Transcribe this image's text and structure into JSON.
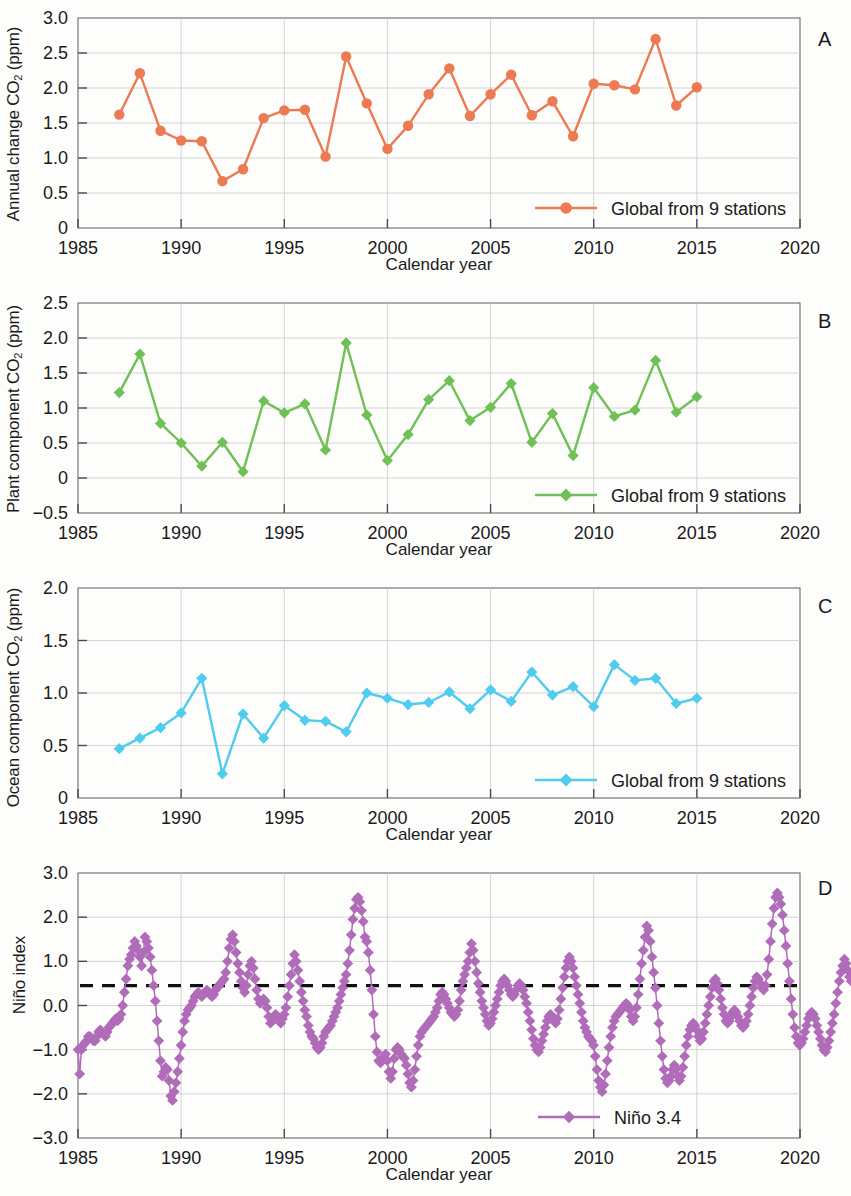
{
  "figure": {
    "xlabel": "Calendar year",
    "panel_letters": [
      "A",
      "B",
      "C",
      "D"
    ]
  },
  "panels": {
    "a": {
      "letter": "A",
      "ylabel_main": "Annual change CO",
      "ylabel_sub": "2",
      "ylabel_tail": " (ppm)",
      "xlabel": "Calendar year",
      "legend": "Global from 9 stations",
      "color": "#EC7A52"
    },
    "b": {
      "letter": "B",
      "ylabel_main": "Plant component CO",
      "ylabel_sub": "2",
      "ylabel_tail": " (ppm)",
      "xlabel": "Calendar year",
      "legend": "Global from 9 stations",
      "color": "#6FC055"
    },
    "c": {
      "letter": "C",
      "ylabel_main": "Ocean component CO",
      "ylabel_sub": "2",
      "ylabel_tail": " (ppm)",
      "xlabel": "Calendar year",
      "legend": "Global from 9 stations",
      "color": "#4FCCEE"
    },
    "d": {
      "letter": "D",
      "ylabel_main": "Niño index",
      "ylabel_sub": "",
      "ylabel_tail": "",
      "xlabel": "Calendar year",
      "legend": "Niño 3.4",
      "color": "#B06CB8",
      "threshold_label": "0.5",
      "threshold_color": "#111111"
    }
  },
  "chart_data": [
    {
      "id": "panel-a",
      "type": "line",
      "title": "",
      "panel": "A",
      "xlabel": "Calendar year",
      "ylabel": "Annual change CO2 (ppm)",
      "xlim": [
        1985,
        2020
      ],
      "ylim": [
        0,
        3.0
      ],
      "xticks": [
        1985,
        1990,
        1995,
        2000,
        2005,
        2010,
        2015,
        2020
      ],
      "yticks": [
        0,
        0.5,
        1.0,
        1.5,
        2.0,
        2.5,
        3.0
      ],
      "ytick_labels": [
        "0",
        "0.5",
        "1.0",
        "1.5",
        "2.0",
        "2.5",
        "3.0"
      ],
      "grid": true,
      "legend_position": "bottom-right",
      "marker": "circle",
      "color": "#EC7A52",
      "series": [
        {
          "name": "Global from 9 stations",
          "x": [
            1987,
            1988,
            1989,
            1990,
            1991,
            1992,
            1993,
            1994,
            1995,
            1996,
            1997,
            1998,
            1999,
            2000,
            2001,
            2002,
            2003,
            2004,
            2005,
            2006,
            2007,
            2008,
            2009,
            2010,
            2011,
            2012,
            2013,
            2014,
            2015
          ],
          "values": [
            1.62,
            2.21,
            1.39,
            1.25,
            1.24,
            0.67,
            0.84,
            1.57,
            1.68,
            1.69,
            1.02,
            2.45,
            1.78,
            1.13,
            1.46,
            1.91,
            2.28,
            1.6,
            1.91,
            2.19,
            1.61,
            1.81,
            1.31,
            2.06,
            2.04,
            1.98,
            2.7,
            1.75,
            2.01
          ]
        }
      ]
    },
    {
      "id": "panel-b",
      "type": "line",
      "title": "",
      "panel": "B",
      "xlabel": "Calendar year",
      "ylabel": "Plant component CO2 (ppm)",
      "xlim": [
        1985,
        2020
      ],
      "ylim": [
        -0.5,
        2.5
      ],
      "xticks": [
        1985,
        1990,
        1995,
        2000,
        2005,
        2010,
        2015,
        2020
      ],
      "yticks": [
        -0.5,
        0,
        0.5,
        1.0,
        1.5,
        2.0,
        2.5
      ],
      "ytick_labels": [
        "−0.5",
        "0",
        "0.5",
        "1.0",
        "1.5",
        "2.0",
        "2.5"
      ],
      "grid": true,
      "legend_position": "bottom-right",
      "marker": "diamond",
      "color": "#6FC055",
      "series": [
        {
          "name": "Global from 9 stations",
          "x": [
            1987,
            1988,
            1989,
            1990,
            1991,
            1992,
            1993,
            1994,
            1995,
            1996,
            1997,
            1998,
            1999,
            2000,
            2001,
            2002,
            2003,
            2004,
            2005,
            2006,
            2007,
            2008,
            2009,
            2010,
            2011,
            2012,
            2013,
            2014,
            2015
          ],
          "values": [
            1.22,
            1.77,
            0.78,
            0.5,
            0.17,
            0.51,
            0.09,
            1.1,
            0.93,
            1.06,
            0.4,
            1.93,
            0.9,
            0.25,
            0.62,
            1.12,
            1.39,
            0.82,
            1.01,
            1.35,
            0.51,
            0.92,
            0.32,
            1.29,
            0.88,
            0.97,
            1.68,
            0.94,
            1.16
          ]
        }
      ]
    },
    {
      "id": "panel-c",
      "type": "line",
      "title": "",
      "panel": "C",
      "xlabel": "Calendar year",
      "ylabel": "Ocean component CO2 (ppm)",
      "xlim": [
        1985,
        2020
      ],
      "ylim": [
        0,
        2.0
      ],
      "xticks": [
        1985,
        1990,
        1995,
        2000,
        2005,
        2010,
        2015,
        2020
      ],
      "yticks": [
        0,
        0.5,
        1.0,
        1.5,
        2.0
      ],
      "ytick_labels": [
        "0",
        "0.5",
        "1.0",
        "1.5",
        "2.0"
      ],
      "grid": true,
      "legend_position": "bottom-right",
      "marker": "diamond",
      "color": "#4FCCEE",
      "series": [
        {
          "name": "Global from 9 stations",
          "x": [
            1987,
            1988,
            1989,
            1990,
            1991,
            1992,
            1993,
            1994,
            1995,
            1996,
            1997,
            1998,
            1999,
            2000,
            2001,
            2002,
            2003,
            2004,
            2005,
            2006,
            2007,
            2008,
            2009,
            2010,
            2011,
            2012,
            2013,
            2014,
            2015
          ],
          "values": [
            0.47,
            0.57,
            0.67,
            0.81,
            1.14,
            0.23,
            0.8,
            0.57,
            0.88,
            0.74,
            0.73,
            0.63,
            1.0,
            0.95,
            0.89,
            0.91,
            1.01,
            0.85,
            1.03,
            0.92,
            1.2,
            0.98,
            1.06,
            0.87,
            1.27,
            1.12,
            1.14,
            0.9,
            0.95
          ]
        }
      ]
    },
    {
      "id": "panel-d",
      "type": "line",
      "title": "",
      "panel": "D",
      "xlabel": "Calendar year",
      "ylabel": "Niño index",
      "xlim": [
        1985,
        2020
      ],
      "ylim": [
        -3.0,
        3.0
      ],
      "xticks": [
        1985,
        1990,
        1995,
        2000,
        2005,
        2010,
        2015,
        2020
      ],
      "yticks": [
        -3.0,
        -2.0,
        -1.0,
        0.0,
        1.0,
        2.0,
        3.0
      ],
      "ytick_labels": [
        "−3.0",
        "−2.0",
        "−1.0",
        "0.0",
        "1.0",
        "2.0",
        "3.0"
      ],
      "grid": true,
      "legend_position": "bottom-center",
      "marker": "diamond",
      "color": "#B06CB8",
      "threshold_line": 0.45,
      "series": [
        {
          "name": "Niño 3.4",
          "x_start": 1985.0,
          "x_step": 0.0833,
          "values": [
            -1.0,
            -1.55,
            -1.0,
            -0.9,
            -0.85,
            -0.8,
            -0.7,
            -0.7,
            -0.75,
            -0.8,
            -0.8,
            -0.7,
            -0.6,
            -0.55,
            -0.6,
            -0.65,
            -0.7,
            -0.6,
            -0.5,
            -0.45,
            -0.4,
            -0.35,
            -0.3,
            -0.35,
            -0.3,
            -0.2,
            0.0,
            0.3,
            0.6,
            0.9,
            1.05,
            1.15,
            1.3,
            1.45,
            1.35,
            1.25,
            1.1,
            0.9,
            1.2,
            1.55,
            1.45,
            1.3,
            1.1,
            0.8,
            0.45,
            0.1,
            -0.35,
            -0.8,
            -1.25,
            -1.6,
            -1.5,
            -1.4,
            -1.45,
            -1.7,
            -2.05,
            -2.15,
            -1.95,
            -1.75,
            -1.5,
            -1.2,
            -0.9,
            -0.6,
            -0.35,
            -0.2,
            -0.1,
            -0.05,
            0.0,
            0.1,
            0.2,
            0.25,
            0.3,
            0.25,
            0.2,
            0.25,
            0.3,
            0.35,
            0.3,
            0.25,
            0.2,
            0.25,
            0.35,
            0.4,
            0.45,
            0.5,
            0.55,
            0.6,
            0.75,
            1.0,
            1.3,
            1.5,
            1.6,
            1.45,
            1.2,
            0.95,
            0.75,
            0.55,
            0.4,
            0.3,
            0.45,
            0.7,
            0.9,
            1.0,
            0.85,
            0.6,
            0.35,
            0.15,
            0.05,
            0.1,
            0.15,
            0.1,
            -0.05,
            -0.25,
            -0.4,
            -0.35,
            -0.25,
            -0.2,
            -0.25,
            -0.35,
            -0.4,
            -0.3,
            -0.2,
            -0.05,
            0.2,
            0.45,
            0.7,
            0.95,
            1.15,
            1.0,
            0.8,
            0.55,
            0.3,
            0.1,
            -0.1,
            -0.25,
            -0.45,
            -0.6,
            -0.7,
            -0.75,
            -0.85,
            -0.95,
            -1.0,
            -0.95,
            -0.85,
            -0.7,
            -0.6,
            -0.55,
            -0.5,
            -0.45,
            -0.35,
            -0.25,
            -0.15,
            -0.05,
            0.1,
            0.25,
            0.4,
            0.55,
            0.7,
            0.95,
            1.25,
            1.6,
            1.95,
            2.2,
            2.4,
            2.45,
            2.35,
            2.15,
            1.9,
            1.55,
            1.45,
            1.2,
            0.8,
            0.35,
            -0.2,
            -0.7,
            -1.05,
            -1.25,
            -1.3,
            -1.25,
            -1.15,
            -1.1,
            -1.25,
            -1.5,
            -1.65,
            -1.5,
            -1.2,
            -1.0,
            -0.95,
            -1.0,
            -1.1,
            -1.15,
            -1.2,
            -1.35,
            -1.55,
            -1.75,
            -1.85,
            -1.7,
            -1.45,
            -1.15,
            -0.9,
            -0.7,
            -0.6,
            -0.55,
            -0.5,
            -0.45,
            -0.4,
            -0.35,
            -0.3,
            -0.25,
            -0.15,
            -0.05,
            0.1,
            0.25,
            0.3,
            0.25,
            0.15,
            0.05,
            -0.05,
            -0.15,
            -0.2,
            -0.25,
            -0.2,
            -0.1,
            0.1,
            0.35,
            0.55,
            0.7,
            0.85,
            1.0,
            1.2,
            1.4,
            1.25,
            1.0,
            0.75,
            0.5,
            0.3,
            0.1,
            -0.05,
            -0.2,
            -0.35,
            -0.45,
            -0.4,
            -0.3,
            -0.15,
            0.0,
            0.15,
            0.3,
            0.45,
            0.55,
            0.6,
            0.55,
            0.45,
            0.35,
            0.25,
            0.2,
            0.25,
            0.35,
            0.45,
            0.5,
            0.45,
            0.35,
            0.2,
            0.05,
            -0.15,
            -0.35,
            -0.55,
            -0.75,
            -0.9,
            -1.0,
            -1.05,
            -0.95,
            -0.8,
            -0.65,
            -0.5,
            -0.35,
            -0.25,
            -0.2,
            -0.25,
            -0.35,
            -0.4,
            -0.3,
            -0.1,
            0.15,
            0.4,
            0.65,
            0.85,
            1.0,
            1.1,
            1.0,
            0.85,
            0.65,
            0.45,
            0.25,
            0.05,
            -0.15,
            -0.35,
            -0.5,
            -0.6,
            -0.7,
            -0.75,
            -0.8,
            -0.9,
            -1.15,
            -1.45,
            -1.7,
            -1.85,
            -1.95,
            -1.8,
            -1.55,
            -1.25,
            -0.95,
            -0.7,
            -0.5,
            -0.35,
            -0.25,
            -0.2,
            -0.15,
            -0.1,
            -0.05,
            0.0,
            0.05,
            0.0,
            -0.1,
            -0.25,
            -0.35,
            -0.25,
            -0.05,
            0.25,
            0.6,
            0.95,
            1.25,
            1.55,
            1.8,
            1.7,
            1.45,
            1.1,
            0.75,
            0.4,
            0.0,
            -0.4,
            -0.8,
            -1.15,
            -1.45,
            -1.65,
            -1.75,
            -1.7,
            -1.6,
            -1.45,
            -1.35,
            -1.45,
            -1.6,
            -1.7,
            -1.6,
            -1.4,
            -1.15,
            -0.9,
            -0.7,
            -0.55,
            -0.45,
            -0.4,
            -0.45,
            -0.55,
            -0.7,
            -0.8,
            -0.75,
            -0.6,
            -0.4,
            -0.2,
            0.0,
            0.2,
            0.4,
            0.55,
            0.6,
            0.5,
            0.35,
            0.15,
            -0.05,
            -0.2,
            -0.35,
            -0.4,
            -0.35,
            -0.25,
            -0.15,
            -0.1,
            -0.15,
            -0.25,
            -0.35,
            -0.45,
            -0.5,
            -0.45,
            -0.35,
            -0.2,
            0.0,
            0.2,
            0.4,
            0.55,
            0.65,
            0.6,
            0.5,
            0.4,
            0.35,
            0.45,
            0.7,
            1.05,
            1.45,
            1.85,
            2.2,
            2.45,
            2.55,
            2.45,
            2.3,
            2.05,
            1.7,
            1.35,
            0.95,
            0.55,
            0.15,
            -0.2,
            -0.5,
            -0.7,
            -0.85,
            -0.9,
            -0.85,
            -0.75,
            -0.6,
            -0.45,
            -0.3,
            -0.2,
            -0.15,
            -0.2,
            -0.3,
            -0.45,
            -0.6,
            -0.75,
            -0.9,
            -1.0,
            -1.05,
            -0.95,
            -0.8,
            -0.6,
            -0.4,
            -0.2,
            0.05,
            0.3,
            0.55,
            0.75,
            0.9,
            1.05,
            0.95,
            0.8,
            0.65,
            0.55,
            0.6,
            0.7
          ]
        }
      ]
    }
  ]
}
